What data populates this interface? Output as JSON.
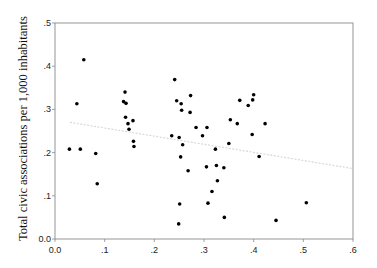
{
  "chart_data": {
    "type": "scatter",
    "title": "",
    "xlabel": "",
    "ylabel": "Total civic associations per 1,000 inhabitants",
    "xlim": [
      0,
      0.6
    ],
    "ylim": [
      0,
      0.5
    ],
    "x_ticks": [
      0,
      0.1,
      0.2,
      0.3,
      0.4,
      0.5,
      0.6
    ],
    "x_tick_labels": [
      "0.0",
      ".1",
      ".2",
      ".3",
      ".4",
      ".5",
      ".6"
    ],
    "y_ticks": [
      0,
      0.1,
      0.2,
      0.3,
      0.4,
      0.5
    ],
    "y_tick_labels": [
      "0.0",
      ".1",
      ".2",
      ".3",
      ".4",
      ".5"
    ],
    "grid": false,
    "legend": null,
    "points": [
      [
        0.029,
        0.208
      ],
      [
        0.044,
        0.313
      ],
      [
        0.051,
        0.208
      ],
      [
        0.058,
        0.415
      ],
      [
        0.082,
        0.198
      ],
      [
        0.085,
        0.128
      ],
      [
        0.141,
        0.34
      ],
      [
        0.138,
        0.318
      ],
      [
        0.143,
        0.314
      ],
      [
        0.142,
        0.282
      ],
      [
        0.147,
        0.267
      ],
      [
        0.149,
        0.254
      ],
      [
        0.157,
        0.274
      ],
      [
        0.158,
        0.226
      ],
      [
        0.159,
        0.214
      ],
      [
        0.241,
        0.369
      ],
      [
        0.245,
        0.32
      ],
      [
        0.254,
        0.313
      ],
      [
        0.255,
        0.298
      ],
      [
        0.235,
        0.239
      ],
      [
        0.25,
        0.235
      ],
      [
        0.257,
        0.218
      ],
      [
        0.253,
        0.19
      ],
      [
        0.273,
        0.332
      ],
      [
        0.272,
        0.293
      ],
      [
        0.284,
        0.258
      ],
      [
        0.297,
        0.239
      ],
      [
        0.306,
        0.258
      ],
      [
        0.268,
        0.158
      ],
      [
        0.305,
        0.167
      ],
      [
        0.323,
        0.208
      ],
      [
        0.325,
        0.17
      ],
      [
        0.327,
        0.135
      ],
      [
        0.316,
        0.11
      ],
      [
        0.251,
        0.081
      ],
      [
        0.308,
        0.083
      ],
      [
        0.249,
        0.035
      ],
      [
        0.341,
        0.05
      ],
      [
        0.34,
        0.165
      ],
      [
        0.35,
        0.221
      ],
      [
        0.353,
        0.276
      ],
      [
        0.367,
        0.267
      ],
      [
        0.372,
        0.321
      ],
      [
        0.389,
        0.309
      ],
      [
        0.398,
        0.322
      ],
      [
        0.4,
        0.334
      ],
      [
        0.397,
        0.242
      ],
      [
        0.411,
        0.191
      ],
      [
        0.423,
        0.267
      ],
      [
        0.445,
        0.043
      ],
      [
        0.506,
        0.084
      ]
    ],
    "trend_line": {
      "x": [
        0.03,
        0.6
      ],
      "y": [
        0.27,
        0.163
      ],
      "color": "#d8d8d8"
    },
    "colors": {
      "points": "#000000",
      "axis": "#8a8a8a",
      "trend": "#d8d8d8"
    }
  }
}
